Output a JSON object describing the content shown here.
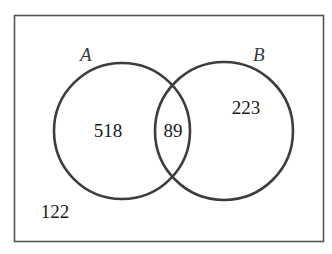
{
  "diagram": {
    "type": "venn",
    "universe": {
      "outside_value": "122"
    },
    "sets": [
      {
        "name": "A",
        "label": "A",
        "only_value": "518"
      },
      {
        "name": "B",
        "label": "B",
        "only_value": "223"
      }
    ],
    "intersection": {
      "sets": [
        "A",
        "B"
      ],
      "value": "89"
    },
    "colors": {
      "stroke": "#3d3d3d",
      "frame": "#555555",
      "background": "#ffffff",
      "text": "#1a1a1a"
    }
  }
}
